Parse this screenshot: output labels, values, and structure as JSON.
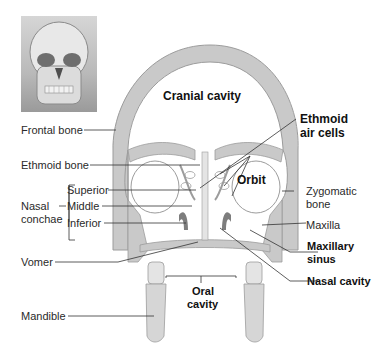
{
  "thumbnail": {
    "description": "skull-anterior-view"
  },
  "labels": {
    "cranial_cavity": "Cranial cavity",
    "frontal_bone": "Frontal bone",
    "ethmoid_bone": "Ethmoid bone",
    "ethmoid_air_cells_line1": "Ethmoid",
    "ethmoid_air_cells_line2": "air cells",
    "orbit": "Orbit",
    "nasal_conchae_line1": "Nasal",
    "nasal_conchae_line2": "conchae",
    "superior": "Superior",
    "middle": "Middle",
    "inferior": "Inferior",
    "zygomatic_line1": "Zygomatic",
    "zygomatic_line2": "bone",
    "maxilla": "Maxilla",
    "maxillary_sinus_line1": "Maxillary",
    "maxillary_sinus_line2": "sinus",
    "vomer": "Vomer",
    "nasal_cavity": "Nasal cavity",
    "oral_cavity_line1": "Oral",
    "oral_cavity_line2": "cavity",
    "mandible": "Mandible"
  },
  "colors": {
    "bone": "#c9c9c9",
    "bone_edge": "#9c9c9c",
    "light_bone": "#e4e4e4",
    "concha": "#7d7d7d",
    "leader": "#333333"
  }
}
